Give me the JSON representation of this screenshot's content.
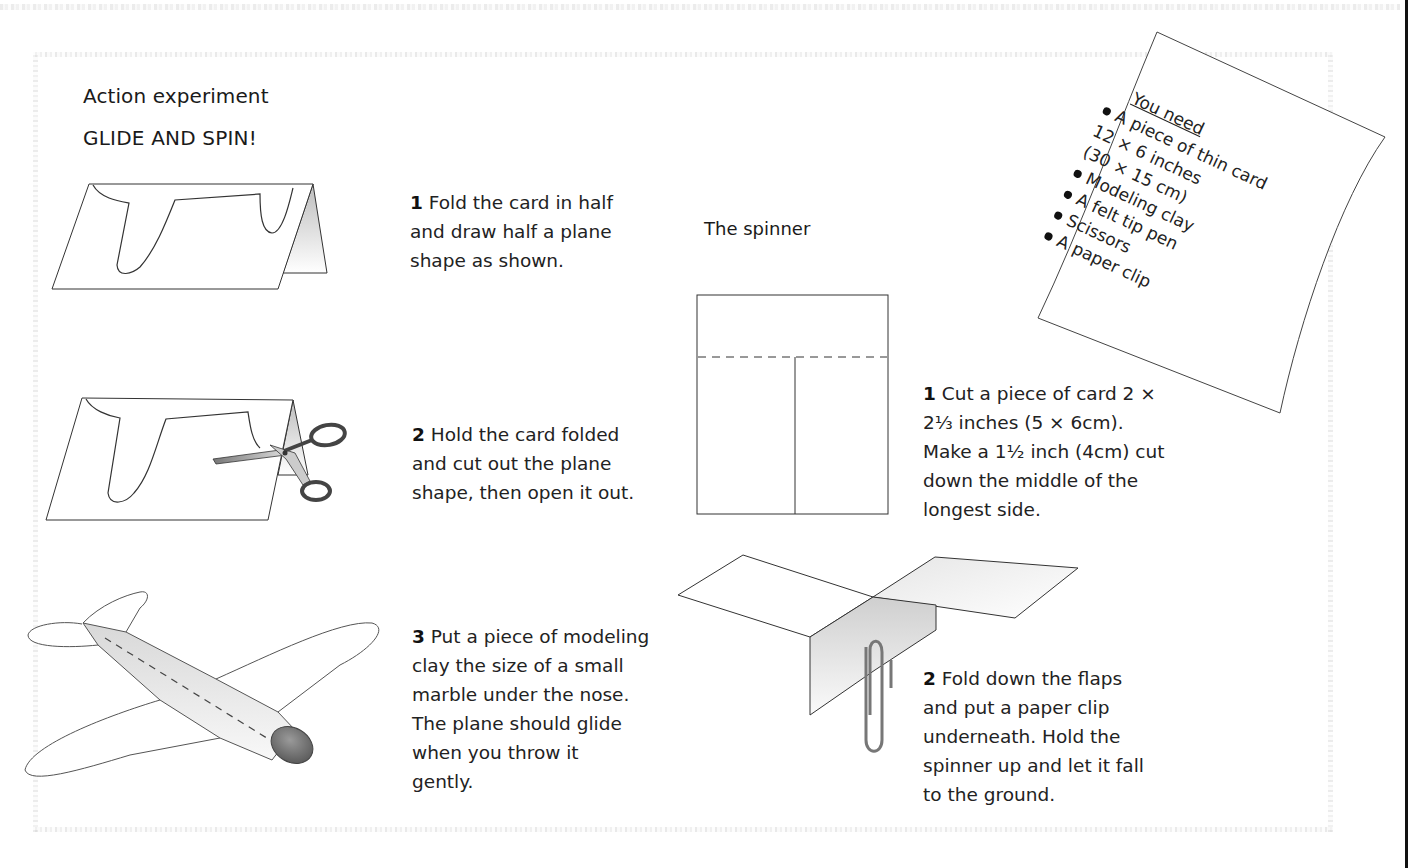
{
  "page": {
    "kicker": "Action experiment",
    "title": "GLIDE AND SPIN!"
  },
  "glider_steps": [
    {
      "number": "1",
      "text": "Fold the card in half",
      "lines": [
        "Fold the card in half",
        "and draw half a plane",
        "shape as shown."
      ]
    },
    {
      "number": "2",
      "lines": [
        "Hold the card folded",
        "and cut out the plane",
        "shape, then open it out."
      ]
    },
    {
      "number": "3",
      "lines": [
        "Put a piece of modeling",
        "clay the size of a small",
        "marble under the nose.",
        "The plane should glide",
        "when you throw it",
        "gently."
      ]
    }
  ],
  "spinner": {
    "title": "The spinner",
    "steps": [
      {
        "number": "1",
        "lines": [
          "Cut a piece of card 2 ×",
          "2⅓ inches (5 × 6cm).",
          "Make a 1½ inch (4cm) cut",
          "down the middle of the",
          "longest side."
        ]
      },
      {
        "number": "2",
        "lines": [
          "Fold down the flaps",
          "and put a paper clip",
          "underneath. Hold the",
          "spinner up and let it fall",
          "to the ground."
        ]
      }
    ]
  },
  "you_need": {
    "heading": "You need",
    "items": [
      {
        "lines": [
          "A piece of thin card",
          "12 × 6 inches",
          "(30 × 15 cm)"
        ]
      },
      {
        "lines": [
          "Modeling clay"
        ]
      },
      {
        "lines": [
          "A felt tip pen"
        ]
      },
      {
        "lines": [
          "Scissors"
        ]
      },
      {
        "lines": [
          "A paper clip"
        ]
      }
    ]
  },
  "illustrations": {
    "fold_card": "folded-card-with-plane-outline",
    "cut_card": "scissors-cutting-folded-card",
    "glider": "paper-glider-with-clay-nose",
    "spinner_template": "spinner-card-with-cut-line",
    "spinner_folded": "folded-spinner-with-paper-clip"
  },
  "colors": {
    "ink": "#1a1a1a",
    "clay_nose": "#7a7a7a",
    "fold_shade": "#cfcfcf"
  }
}
